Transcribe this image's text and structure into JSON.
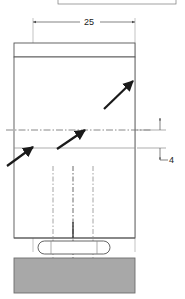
{
  "drawing": {
    "title": "sectional-view-with-leader-arrows",
    "dimensions": {
      "width_label": "25",
      "height_label": "4"
    },
    "partial_top_label": "",
    "colors": {
      "outline": "#555555",
      "thin_line": "#8a8a8a",
      "center_line": "#6b6b6b",
      "arrow": "#1a1a1a",
      "hatch_fill": "#a8a8a8",
      "hatch_stroke": "#6e6e6e",
      "background": "#ffffff",
      "crumb_border": "#7a7a7a"
    },
    "parts": {
      "top_plate_name": "top-plate",
      "body_name": "main-body",
      "slot_name": "obround-slot",
      "base_name": "hatched-base"
    },
    "annotations": [
      {
        "name": "leader-arrow-upper-right",
        "x1": 104,
        "y1": 109,
        "x2": 133,
        "y2": 81
      },
      {
        "name": "leader-arrow-middle",
        "x1": 57,
        "y1": 149,
        "x2": 85,
        "y2": 130
      },
      {
        "name": "leader-arrow-lower-left",
        "x1": 7,
        "y1": 166,
        "x2": 33,
        "y2": 147
      }
    ],
    "center_lines": {
      "horizontal_y": 130,
      "vertical_xs": [
        53,
        73,
        93
      ]
    }
  }
}
